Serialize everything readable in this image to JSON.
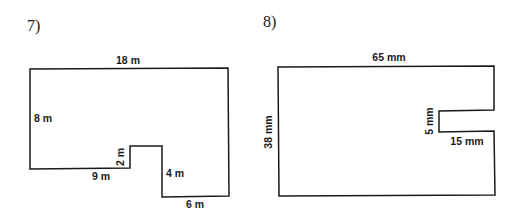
{
  "figures": [
    {
      "number": "7)",
      "labels": {
        "top": "18 m",
        "left": "8 m",
        "notch_height": "2 m",
        "bottom_left": "9 m",
        "step_height": "4 m",
        "bottom_right": "6 m"
      }
    },
    {
      "number": "8)",
      "labels": {
        "top": "65 mm",
        "left": "38 mm",
        "notch_height": "5 mm",
        "notch_depth": "15 mm"
      }
    }
  ]
}
